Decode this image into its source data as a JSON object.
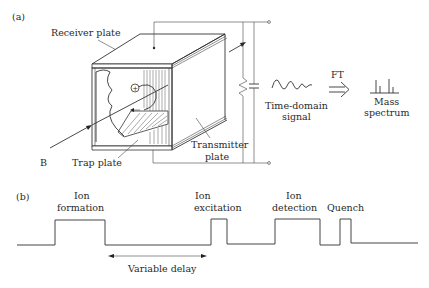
{
  "figure": {
    "panel_a": {
      "label": "(a)",
      "labels": {
        "receiver_plate": "Receiver plate",
        "trap_plate": "Trap plate",
        "transmitter_plate_line1": "Transmitter",
        "transmitter_plate_line2": "plate",
        "magnetic_field": "B",
        "ion_symbol": "+",
        "time_domain_line1": "Time-domain",
        "time_domain_line2": "signal",
        "ft": "FT",
        "mass_spectrum_line1": "Mass",
        "mass_spectrum_line2": "spectrum"
      },
      "icons": [
        "icr-cell",
        "resistor",
        "capacitor",
        "sine-wave",
        "double-arrow",
        "spectrum-peaks"
      ]
    },
    "panel_b": {
      "label": "(b)",
      "pulses": [
        {
          "line1": "Ion",
          "line2": "formation"
        },
        {
          "line1": "Ion",
          "line2": "excitation"
        },
        {
          "line1": "Ion",
          "line2": "detection"
        },
        {
          "line1": "Quench",
          "line2": ""
        }
      ],
      "delay_label": "Variable delay"
    }
  }
}
